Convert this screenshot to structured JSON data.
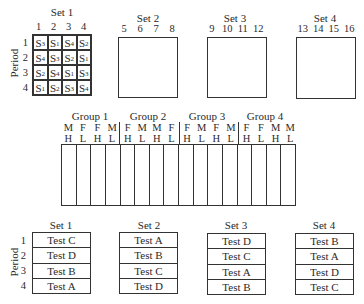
{
  "period_label": "Period",
  "periods": [
    "1",
    "2",
    "3",
    "4"
  ],
  "top_sets": [
    {
      "title": "Set 1",
      "columns": [
        "1",
        "2",
        "3",
        "4"
      ],
      "grid": [
        [
          {
            "s": "S",
            "n": "3"
          },
          {
            "s": "S",
            "n": "1"
          },
          {
            "s": "S",
            "n": "4"
          },
          {
            "s": "S",
            "n": "2"
          }
        ],
        [
          {
            "s": "S",
            "n": "4"
          },
          {
            "s": "S",
            "n": "3"
          },
          {
            "s": "S",
            "n": "2"
          },
          {
            "s": "S",
            "n": "1"
          }
        ],
        [
          {
            "s": "S",
            "n": "2"
          },
          {
            "s": "S",
            "n": "4"
          },
          {
            "s": "S",
            "n": "1"
          },
          {
            "s": "S",
            "n": "3"
          }
        ],
        [
          {
            "s": "S",
            "n": "1"
          },
          {
            "s": "S",
            "n": "2"
          },
          {
            "s": "S",
            "n": "3"
          },
          {
            "s": "S",
            "n": "4"
          }
        ]
      ]
    },
    {
      "title": "Set 2",
      "columns": [
        "5",
        "6",
        "7",
        "8"
      ]
    },
    {
      "title": "Set 3",
      "columns": [
        "9",
        "10",
        "11",
        "12"
      ]
    },
    {
      "title": "Set 4",
      "columns": [
        "13",
        "14",
        "15",
        "16"
      ]
    }
  ],
  "groups": [
    {
      "title": "Group 1",
      "sex": [
        "M",
        "F",
        "F",
        "M"
      ],
      "level": [
        "H",
        "L",
        "H",
        "L"
      ]
    },
    {
      "title": "Group 2",
      "sex": [
        "F",
        "M",
        "M",
        "F"
      ],
      "level": [
        "H",
        "L",
        "H",
        "L"
      ]
    },
    {
      "title": "Group 3",
      "sex": [
        "F",
        "M",
        "F",
        "M"
      ],
      "level": [
        "H",
        "L",
        "H",
        "L"
      ]
    },
    {
      "title": "Group 4",
      "sex": [
        "F",
        "F",
        "M",
        "M"
      ],
      "level": [
        "H",
        "L",
        "H",
        "L"
      ]
    }
  ],
  "bottom_sets": [
    {
      "title": "Set 1",
      "tests": [
        "Test C",
        "Test D",
        "Test B",
        "Test A"
      ]
    },
    {
      "title": "Set 2",
      "tests": [
        "Test A",
        "Test B",
        "Test C",
        "Test D"
      ]
    },
    {
      "title": "Set 3",
      "tests": [
        "Test D",
        "Test C",
        "Test A",
        "Test B"
      ]
    },
    {
      "title": "Set 4",
      "tests": [
        "Test B",
        "Test A",
        "Test D",
        "Test C"
      ]
    }
  ]
}
